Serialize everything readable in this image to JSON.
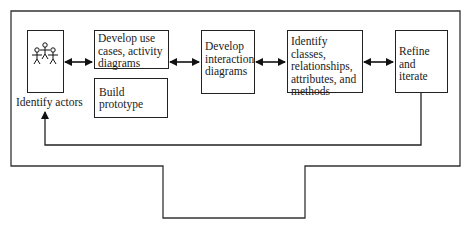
{
  "diagram": {
    "type": "process-flow",
    "nodes": {
      "actors": {
        "label": "Identify actors",
        "icon": "actors-icon"
      },
      "use_cases": {
        "label": "Develop use cases, activity diagrams"
      },
      "prototype": {
        "label": "Build prototype"
      },
      "interaction": {
        "label": "Develop interaction diagrams"
      },
      "classes": {
        "label": "Identify classes, relationships, attributes, and methods"
      },
      "refine": {
        "label": "Refine and iterate"
      }
    },
    "edges": [
      {
        "from": "actors",
        "to": "use_cases",
        "style": "bidirectional-arrow"
      },
      {
        "from": "use_cases",
        "to": "interaction",
        "style": "bidirectional-arrow"
      },
      {
        "from": "interaction",
        "to": "classes",
        "style": "bidirectional-arrow"
      },
      {
        "from": "classes",
        "to": "refine",
        "style": "bidirectional-arrow"
      },
      {
        "from": "refine",
        "to": "actors",
        "style": "feedback-arrow"
      }
    ],
    "colors": {
      "stroke": "#222222",
      "background": "#ffffff"
    }
  }
}
